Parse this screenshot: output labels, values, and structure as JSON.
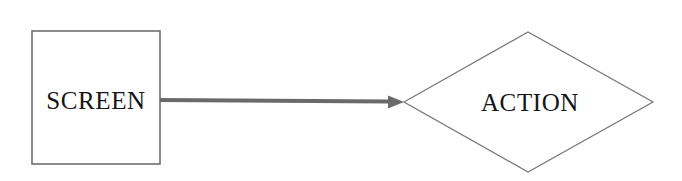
{
  "diagram": {
    "type": "flowchart",
    "background_color": "#ffffff",
    "nodes": [
      {
        "id": "screen",
        "label": "SCREEN",
        "shape": "rectangle",
        "x": 32,
        "y": 31,
        "width": 128,
        "height": 133,
        "center_x": 96,
        "center_y": 100,
        "stroke_color": "#6f6f6f",
        "stroke_width": 1.6,
        "fill_color": "#ffffff",
        "text_color": "#151515"
      },
      {
        "id": "action",
        "label": "ACTION",
        "shape": "diamond",
        "left_vertex_x": 404,
        "right_vertex_x": 653,
        "top_vertex_y": 32,
        "bottom_vertex_y": 172,
        "center_x": 528,
        "center_y": 102,
        "stroke_color": "#7a7a7a",
        "stroke_width": 1.3,
        "fill_color": "#ffffff",
        "text_color": "#151515"
      }
    ],
    "connectors": [
      {
        "id": "screen-to-action",
        "from": "screen",
        "to": "action",
        "style": "solid-arrow",
        "direction": "left-to-right",
        "start_x": 160,
        "start_y": 100,
        "end_x": 404,
        "end_y": 102,
        "color": "#6a6a6a",
        "line_width": 4,
        "arrowhead": "filled-triangle",
        "arrowhead_length": 17,
        "arrowhead_width": 13
      }
    ]
  }
}
